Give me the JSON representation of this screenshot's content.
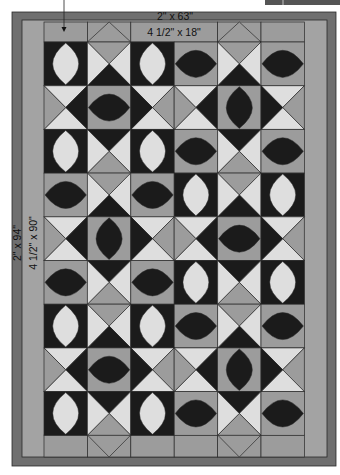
{
  "colors": {
    "outer_border": "#6f6f6f",
    "inner_border": "#a3a3a3",
    "gray": "#9c9c9c",
    "light": "#dedede",
    "black": "#1b1b1b",
    "line": "#2a2a2a",
    "corner_box": "#555555"
  },
  "labels": {
    "outer_top": "2\" x 63\"",
    "inner_top": "4 1/2\" x 18\"",
    "outer_side": "2\" x 94\"",
    "inner_side": "4 1/2\" x 90\""
  },
  "geometry": {
    "outer": {
      "x": 12,
      "y": 12,
      "w": 324,
      "h": 454
    },
    "inner": {
      "x": 22,
      "y": 20,
      "w": 305,
      "h": 437
    },
    "blocks": {
      "x": 44,
      "y": 42,
      "cols": 6,
      "rows": 9,
      "cell": 43.4,
      "cellh": 43.7
    },
    "top_strip": {
      "y": 22,
      "h": 20
    },
    "bottom_strip": {
      "y": 435,
      "h": 22
    }
  },
  "top_strip": [
    "plain",
    "diamond-up",
    "label",
    "label",
    "diamond-up",
    "plain"
  ],
  "bottom_strip": [
    "plain",
    "diamond-down",
    "plain",
    "plain",
    "diamond-down",
    "plain"
  ],
  "grid": [
    [
      "WV",
      "HG:G,L,B,L",
      "WV",
      "BH",
      "HG:G,L,B,L",
      "BH"
    ],
    [
      "HG:L,B,L,G",
      "BH",
      "HG:L,G,L,B",
      "HG:L,B,L,G",
      "BV",
      "HG:L,G,L,B"
    ],
    [
      "WV",
      "HG:B,L,G,L",
      "WV",
      "BH",
      "HG:B,L,G,L",
      "BH"
    ],
    [
      "BH",
      "HG:G,L,B,L",
      "BH",
      "WV",
      "HG:G,L,B,L",
      "WV"
    ],
    [
      "HG:L,B,L,G",
      "BV",
      "HG:L,G,L,B",
      "HG:L,B,L,G",
      "BH",
      "HG:L,G,L,B"
    ],
    [
      "BH",
      "HG:B,L,G,L",
      "BH",
      "WV",
      "HG:B,L,G,L",
      "WV"
    ],
    [
      "WV",
      "HG:G,L,B,L",
      "WV",
      "BH",
      "HG:G,L,B,L",
      "BH"
    ],
    [
      "HG:L,B,L,G",
      "BH",
      "HG:L,G,L,B",
      "HG:L,B,L,G",
      "BV",
      "HG:L,G,L,B"
    ],
    [
      "WV",
      "HG:B,L,G,L",
      "WV",
      "BH",
      "HG:B,L,G,L",
      "BH"
    ]
  ],
  "legend_codes": {
    "WV": "white vertical leaf on black",
    "BH": "black horizontal leaf on gray",
    "BV": "black vertical leaf on gray",
    "HG": "hourglass triangles: top,right,bottom,left"
  }
}
